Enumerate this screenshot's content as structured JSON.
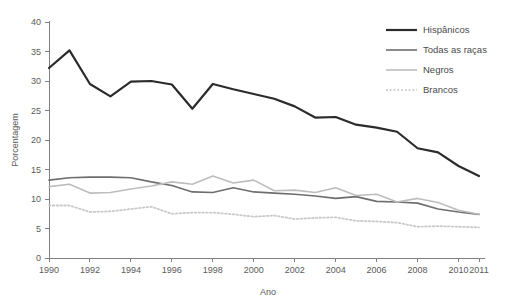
{
  "chart_data": {
    "type": "line",
    "title": "",
    "xlabel": "Ano",
    "ylabel": "Porcentagem",
    "xlim": [
      1990,
      2011
    ],
    "ylim": [
      0,
      40
    ],
    "yticks": [
      0,
      5,
      10,
      15,
      20,
      25,
      30,
      35,
      40
    ],
    "xticks": [
      1990,
      1992,
      1994,
      1996,
      1998,
      2000,
      2002,
      2004,
      2006,
      2008,
      2010,
      2011
    ],
    "x": [
      1990,
      1991,
      1992,
      1993,
      1994,
      1995,
      1996,
      1997,
      1998,
      1999,
      2000,
      2001,
      2002,
      2003,
      2004,
      2005,
      2006,
      2007,
      2008,
      2009,
      2010,
      2011
    ],
    "grid": false,
    "legend_position": "top-right",
    "series": [
      {
        "name": "Hispânicos",
        "color": "#2b2b2b",
        "width": 2.2,
        "dash": "none",
        "values": [
          32.2,
          35.2,
          29.5,
          27.4,
          29.9,
          30.0,
          29.4,
          25.3,
          29.5,
          28.6,
          27.8,
          27.0,
          25.7,
          23.8,
          23.9,
          22.6,
          22.1,
          21.4,
          18.6,
          17.9,
          15.6,
          13.9
        ]
      },
      {
        "name": "Todas as raças",
        "color": "#6e6e6e",
        "width": 1.6,
        "dash": "none",
        "values": [
          13.2,
          13.6,
          13.7,
          13.7,
          13.6,
          12.9,
          12.3,
          11.2,
          11.1,
          11.9,
          11.2,
          11.0,
          10.8,
          10.5,
          10.1,
          10.4,
          9.6,
          9.5,
          9.3,
          8.3,
          7.8,
          7.4
        ]
      },
      {
        "name": "Negros",
        "color": "#bdbdbd",
        "width": 1.6,
        "dash": "none",
        "values": [
          12.1,
          12.5,
          11.0,
          11.1,
          11.7,
          12.2,
          12.9,
          12.5,
          13.9,
          12.7,
          13.2,
          11.4,
          11.5,
          11.1,
          11.9,
          10.6,
          10.8,
          9.5,
          10.1,
          9.4,
          8.1,
          7.4
        ]
      },
      {
        "name": "Brancos",
        "color": "#c9c9c9",
        "width": 1.8,
        "dash": "dotted",
        "values": [
          8.9,
          8.9,
          7.8,
          7.9,
          8.3,
          8.7,
          7.5,
          7.7,
          7.7,
          7.4,
          7.0,
          7.2,
          6.6,
          6.8,
          6.9,
          6.3,
          6.2,
          6.0,
          5.3,
          5.4,
          5.3,
          5.2
        ]
      }
    ]
  },
  "legend": {
    "items": [
      {
        "label": "Hispânicos"
      },
      {
        "label": "Todas as raças"
      },
      {
        "label": "Negros"
      },
      {
        "label": "Brancos"
      }
    ]
  },
  "axes": {
    "y_title": "Porcentagem",
    "x_title": "Ano",
    "y_tick_labels": [
      "0",
      "5",
      "10",
      "15",
      "20",
      "25",
      "30",
      "35",
      "40"
    ],
    "x_tick_labels": [
      "1990",
      "1992",
      "1994",
      "1996",
      "1998",
      "2000",
      "2002",
      "2004",
      "2006",
      "2008",
      "2010",
      "2011"
    ]
  },
  "colors": {
    "hispanicos": "#2b2b2b",
    "todas_as_racas": "#6e6e6e",
    "negros": "#bdbdbd",
    "brancos": "#c9c9c9",
    "axis": "#808080",
    "text": "#4a4a4a",
    "background": "#ffffff"
  }
}
